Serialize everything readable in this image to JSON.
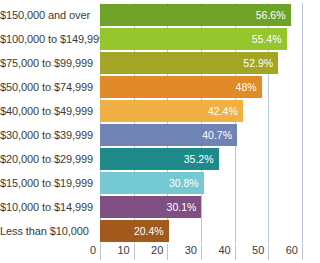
{
  "chart_data": {
    "type": "bar",
    "orientation": "horizontal",
    "title": "",
    "subtitle": "",
    "xlabel": "",
    "ylabel": "",
    "xlim": [
      0,
      60
    ],
    "ylim": null,
    "grid": true,
    "legend": null,
    "xticks": [
      0,
      10,
      20,
      30,
      40,
      50,
      60
    ],
    "xtick_labels": [
      "0",
      "10",
      "20",
      "30",
      "40",
      "50",
      "60"
    ],
    "categories": [
      "$150,000 and over",
      "$100,000 to $149,999",
      "$75,000 to $99,999",
      "$50,000 to $74,999",
      "$40,000 to $49,999",
      "$30,000 to $39,999",
      "$20,000 to $29,999",
      "$15,000 to $19,999",
      "$10,000 to $14,999",
      "Less than $10,000"
    ],
    "values": [
      56.6,
      55.4,
      52.9,
      48,
      42.4,
      40.7,
      35.2,
      30.8,
      30.1,
      20.4
    ],
    "value_labels": [
      "56.6%",
      "55.4%",
      "52.9%",
      "48%",
      "42.4%",
      "40.7%",
      "35.2%",
      "30.8%",
      "30.1%",
      "20.4%"
    ],
    "bar_colors": [
      "#6fa228",
      "#96c party",
      "#a3a524",
      "#e08a28",
      "#f0b044",
      "#7083b5",
      "#1f8a8a",
      "#74c9d2",
      "#7f4f84",
      "#a25a1c"
    ],
    "colors": {
      "gridline": "#b9c6da",
      "axis_text": "#3b3b3b",
      "value_text": "#ffffff",
      "background": "#ffffff"
    }
  },
  "bars": [
    {
      "category": "$150,000 and over",
      "value": 56.6,
      "label": "56.6%",
      "color": "#6fa228"
    },
    {
      "category": "$100,000 to $149,999",
      "value": 55.4,
      "label": "55.4%",
      "color": "#96c52e"
    },
    {
      "category": "$75,000 to $99,999",
      "value": 52.9,
      "label": "52.9%",
      "color": "#a3a524"
    },
    {
      "category": "$50,000 to $74,999",
      "value": 48,
      "label": "48%",
      "color": "#e08a28"
    },
    {
      "category": "$40,000 to $49,999",
      "value": 42.4,
      "label": "42.4%",
      "color": "#f0b044"
    },
    {
      "category": "$30,000 to $39,999",
      "value": 40.7,
      "label": "40.7%",
      "color": "#7083b5"
    },
    {
      "category": "$20,000 to $29,999",
      "value": 35.2,
      "label": "35.2%",
      "color": "#1f8a8a"
    },
    {
      "category": "$15,000 to $19,999",
      "value": 30.8,
      "label": "30.8%",
      "color": "#74c9d2"
    },
    {
      "category": "$10,000 to $14,999",
      "value": 30.1,
      "label": "30.1%",
      "color": "#7f4f84"
    },
    {
      "category": "Less than $10,000",
      "value": 20.4,
      "label": "20.4%",
      "color": "#a25a1c"
    }
  ]
}
